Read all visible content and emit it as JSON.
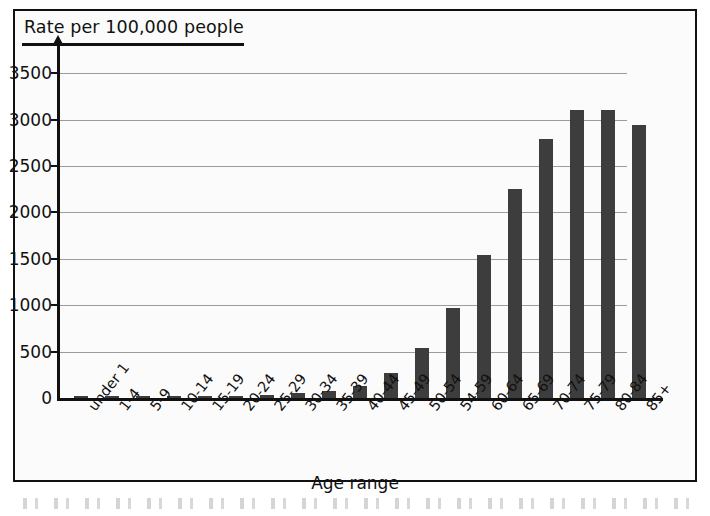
{
  "chart_data": {
    "type": "bar",
    "title": "",
    "ylabel": "Rate per 100,000 people",
    "xlabel": "Age range",
    "categories": [
      "under 1",
      "1-4",
      "5-9",
      "10-14",
      "15-19",
      "20-24",
      "25-29",
      "30-34",
      "35-39",
      "40-44",
      "45-49",
      "50-54",
      "54-59",
      "60-64",
      "65-69",
      "70-74",
      "75-79",
      "80-84",
      "85+"
    ],
    "values": [
      15,
      8,
      5,
      6,
      10,
      20,
      35,
      50,
      75,
      130,
      270,
      540,
      975,
      1540,
      2255,
      2790,
      3105,
      3105,
      2940
    ],
    "ylim": [
      0,
      3750
    ],
    "y_ticks": [
      0,
      500,
      1000,
      1500,
      2000,
      2500,
      3000,
      3500
    ],
    "y_tick_labels": [
      "0",
      "500",
      "1000",
      "1500",
      "2000",
      "2500",
      "3000",
      "3500"
    ],
    "grid": true,
    "grid_axis": "y",
    "legend": false,
    "bar_color": "#3d3d3d",
    "grid_color": "#9c9c9c",
    "axis_color": "#111111",
    "background_color": "#fbfbfb"
  }
}
